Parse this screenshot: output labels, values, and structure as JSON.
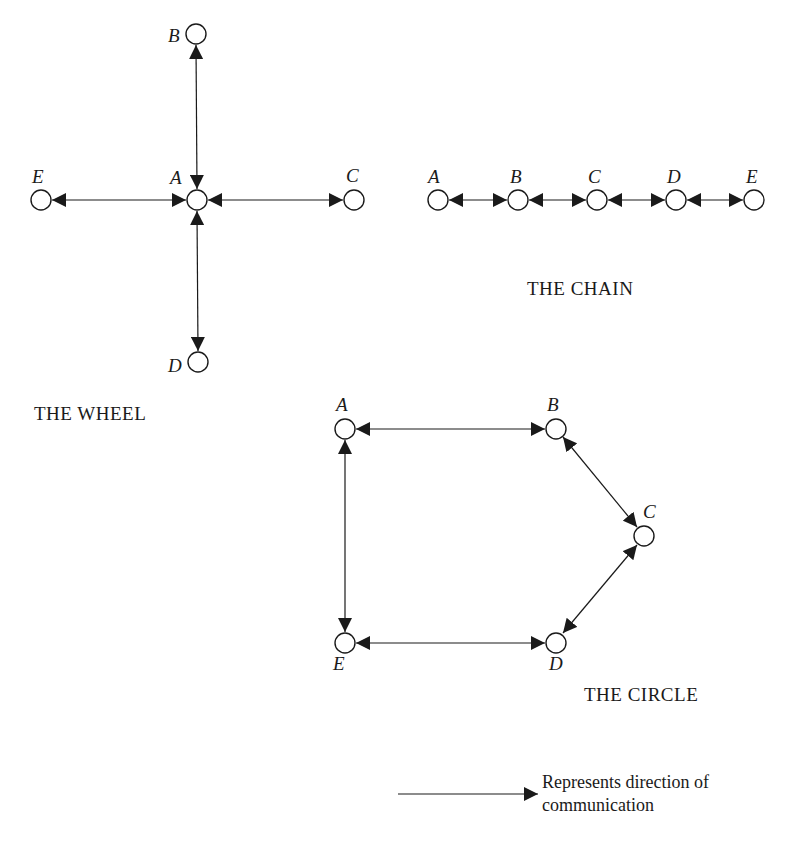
{
  "colors": {
    "ink": "#1a1a1a",
    "background": "#ffffff"
  },
  "networks": {
    "wheel": {
      "title": "THE WHEEL",
      "nodes": {
        "A": "A",
        "B": "B",
        "C": "C",
        "D": "D",
        "E": "E"
      },
      "edges": [
        [
          "A",
          "B"
        ],
        [
          "A",
          "C"
        ],
        [
          "A",
          "D"
        ],
        [
          "A",
          "E"
        ]
      ]
    },
    "chain": {
      "title": "THE CHAIN",
      "nodes": {
        "A": "A",
        "B": "B",
        "C": "C",
        "D": "D",
        "E": "E"
      },
      "edges": [
        [
          "A",
          "B"
        ],
        [
          "B",
          "C"
        ],
        [
          "C",
          "D"
        ],
        [
          "D",
          "E"
        ]
      ]
    },
    "circle": {
      "title": "THE CIRCLE",
      "nodes": {
        "A": "A",
        "B": "B",
        "C": "C",
        "D": "D",
        "E": "E"
      },
      "edges": [
        [
          "A",
          "B"
        ],
        [
          "B",
          "C"
        ],
        [
          "C",
          "D"
        ],
        [
          "D",
          "E"
        ],
        [
          "E",
          "A"
        ]
      ]
    }
  },
  "legend": {
    "line1": "Represents direction of",
    "line2": "communication"
  }
}
